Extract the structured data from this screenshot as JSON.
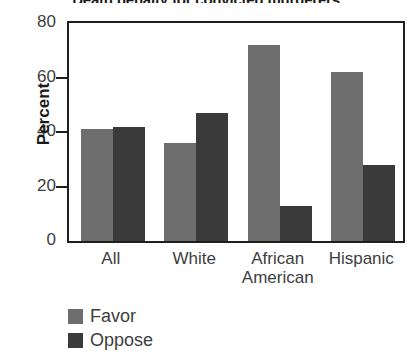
{
  "chart_data": {
    "type": "bar",
    "title": "Death penalty for convicted murderers",
    "xlabel": "",
    "ylabel": "Percent",
    "ylim": [
      0,
      80
    ],
    "yticks": [
      0,
      20,
      40,
      60,
      80
    ],
    "grid": false,
    "legend_position": "bottom-left",
    "categories": [
      "All",
      "White",
      "African\nAmerican",
      "Hispanic"
    ],
    "series": [
      {
        "name": "Favor",
        "color": "#6e6e6e",
        "values": [
          41,
          36,
          72,
          62
        ]
      },
      {
        "name": "Oppose",
        "color": "#3a3a3a",
        "values": [
          42,
          47,
          13,
          28
        ]
      }
    ]
  },
  "axis": {
    "y_label": "Percent",
    "y_ticks": [
      "80",
      "60",
      "40",
      "20",
      "0"
    ],
    "x_ticks": [
      "All",
      "White",
      "African\nAmerican",
      "Hispanic"
    ]
  },
  "legend": {
    "items": [
      {
        "label": "Favor",
        "swatch": "favor-swatch"
      },
      {
        "label": "Oppose",
        "swatch": "oppose-swatch"
      }
    ]
  }
}
